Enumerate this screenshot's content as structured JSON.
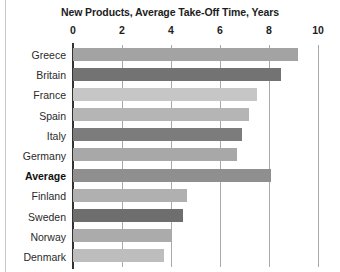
{
  "chart_data": {
    "type": "bar",
    "title": "New Products, Average Take-Off Time, Years",
    "xlabel": "",
    "ylabel": "",
    "orientation": "horizontal",
    "xlim": [
      0,
      10
    ],
    "xticks": [
      0,
      2,
      4,
      6,
      8,
      10
    ],
    "xtick_labels": [
      "0",
      "2",
      "4",
      "6",
      "8",
      "10"
    ],
    "grid": true,
    "gridlines_at": [
      2,
      4,
      6,
      8,
      10
    ],
    "legend": false,
    "legend_position": "none",
    "categories": [
      "Greece",
      "Britain",
      "France",
      "Spain",
      "Italy",
      "Germany",
      "Average",
      "Finland",
      "Sweden",
      "Norway",
      "Denmark"
    ],
    "values": [
      9.2,
      8.5,
      7.5,
      7.2,
      6.9,
      6.7,
      8.1,
      4.65,
      4.5,
      4.0,
      3.7
    ],
    "bar_colors": [
      "#a3a3a3",
      "#737373",
      "#c6c6c6",
      "#b5b5b5",
      "#7c7c7c",
      "#a8a8a8",
      "#8f8f8f",
      "#b0b0b0",
      "#6e6e6e",
      "#ababab",
      "#bdbdbd"
    ],
    "emphasized_category": "Average",
    "annotations": []
  },
  "axis": {
    "color": "#333333",
    "gridline_color": "#a9a9a9"
  },
  "frame": {
    "rule_color": "#c8c8c8"
  }
}
